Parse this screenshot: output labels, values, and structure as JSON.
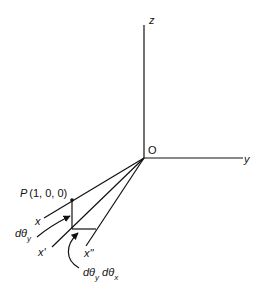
{
  "diagram": {
    "type": "3d-coordinate-rotation",
    "axes": {
      "z_label": "z",
      "y_label": "y",
      "origin_label": "O"
    },
    "point": {
      "label": "P",
      "coords": "(1, 0, 0)"
    },
    "labels": {
      "x": "x",
      "x_prime": "x'",
      "x_double_prime": "x''",
      "d_theta": "dθ",
      "y_sub": "y",
      "x_sub": "x"
    }
  }
}
